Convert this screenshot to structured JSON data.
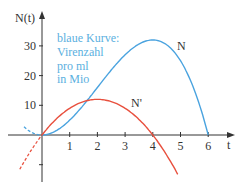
{
  "chart_data": {
    "type": "line",
    "title": "",
    "xlabel": "t",
    "ylabel": "N(t)",
    "xlim": [
      -0.6,
      6.8
    ],
    "ylim": [
      -15,
      40
    ],
    "x_ticks": [
      1,
      2,
      3,
      4,
      5,
      6
    ],
    "y_ticks": [
      -10,
      10,
      20,
      30
    ],
    "y_tick_labels": [
      "",
      "10",
      "20",
      "30"
    ],
    "grid": false,
    "annotation": [
      "blaue Kurve:",
      "Virenzahl",
      "pro ml",
      "in Mio"
    ],
    "series": [
      {
        "name": "N",
        "formula": "6t^2 - t^3",
        "color": "#4aa3df",
        "x": [
          0,
          1,
          2,
          3,
          4,
          5,
          6
        ],
        "values": [
          0,
          5,
          16,
          27,
          32,
          25,
          0
        ],
        "dashed_extension": {
          "from": -0.65,
          "to": 0
        }
      },
      {
        "name": "N'",
        "formula": "12t - 3t^2",
        "color": "#e8503e",
        "x": [
          0,
          1,
          2,
          3,
          4,
          4.9
        ],
        "values": [
          0,
          9,
          12,
          9,
          0,
          -13.2
        ],
        "dashed_extension": {
          "from": -0.8,
          "to": 0
        }
      }
    ]
  },
  "colors": {
    "axis": "#333333",
    "blue": "#4aa3df",
    "red": "#e8503e",
    "note": "#5bb0e0"
  }
}
